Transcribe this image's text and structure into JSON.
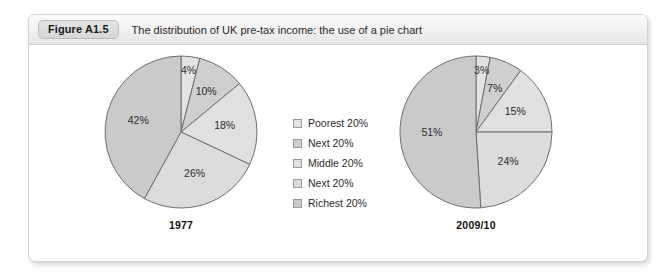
{
  "figure": {
    "badge": "Figure A1.5",
    "caption": "The distribution of UK pre-tax income: the use of a pie chart"
  },
  "legend": {
    "items": [
      {
        "label": "Poorest 20%",
        "color": "#e3e3e3"
      },
      {
        "label": "Next 20%",
        "color": "#cfcfcf"
      },
      {
        "label": "Middle 20%",
        "color": "#e0e0e0"
      },
      {
        "label": "Next 20%",
        "color": "#dcdcdc"
      },
      {
        "label": "Richest 20%",
        "color": "#cacaca"
      }
    ]
  },
  "chart_data": [
    {
      "type": "pie",
      "title": "1977",
      "categories": [
        "Poorest 20%",
        "Next 20%",
        "Middle 20%",
        "Next 20%",
        "Richest 20%"
      ],
      "values": [
        4,
        10,
        18,
        26,
        42
      ],
      "labels": [
        "4%",
        "10%",
        "18%",
        "26%",
        "42%"
      ],
      "colors": [
        "#e3e3e3",
        "#cfcfcf",
        "#e0e0e0",
        "#dcdcdc",
        "#cacaca"
      ],
      "stroke": "#6e6e6e",
      "start_angle_deg": 0,
      "direction": "clockwise",
      "legend_position": "center-between-charts"
    },
    {
      "type": "pie",
      "title": "2009/10",
      "categories": [
        "Poorest 20%",
        "Next 20%",
        "Middle 20%",
        "Next 20%",
        "Richest 20%"
      ],
      "values": [
        3,
        7,
        15,
        24,
        51
      ],
      "labels": [
        "3%",
        "7%",
        "15%",
        "24%",
        "51%"
      ],
      "colors": [
        "#e3e3e3",
        "#cfcfcf",
        "#e0e0e0",
        "#dcdcdc",
        "#cacaca"
      ],
      "stroke": "#6e6e6e",
      "start_angle_deg": 0,
      "direction": "clockwise",
      "legend_position": "center-between-charts"
    }
  ]
}
